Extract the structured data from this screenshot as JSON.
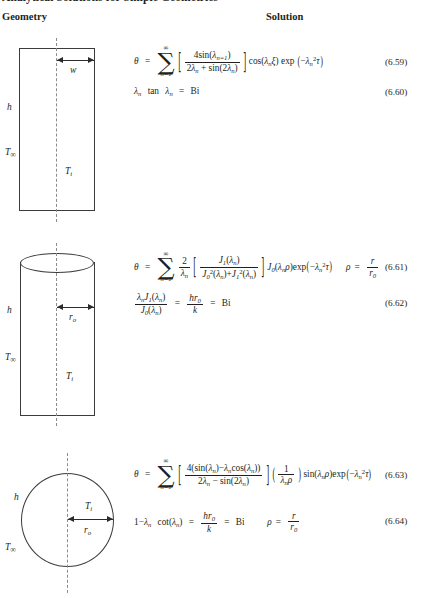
{
  "document": {
    "title": "Analytical Solutions for Simple Geometries",
    "columns": {
      "geometry": "Geometry",
      "solution": "Solution"
    }
  },
  "geometries": [
    {
      "name": "plane-slab",
      "shape": "rectangle",
      "labels": {
        "h": "h",
        "T_inf": "T",
        "T_inf_sub": "∞",
        "T_i": "T",
        "T_i_sub": "i",
        "dimension": "w"
      }
    },
    {
      "name": "infinite-cylinder",
      "shape": "cylinder",
      "labels": {
        "h": "h",
        "T_inf": "T",
        "T_inf_sub": "∞",
        "T_i": "T",
        "T_i_sub": "i",
        "dimension": "r",
        "dimension_sub": "o"
      }
    },
    {
      "name": "sphere",
      "shape": "circle",
      "labels": {
        "h": "h",
        "T_inf": "T",
        "T_inf_sub": "∞",
        "T_i": "T",
        "T_i_sub": "i",
        "dimension": "r",
        "dimension_sub": "o"
      }
    }
  ],
  "equations": [
    {
      "id": "6.59",
      "number": "(6.59)",
      "latex": "\\theta = \\sum_{n=1}^{\\infty}\\left[\\frac{4\\sin(\\lambda_n)}{2\\lambda_n + \\sin(2\\lambda_n)}\\right]\\cos(\\lambda_n\\xi)\\exp\\left(-\\lambda_n^2\\tau\\right)",
      "plain": "theta = sum n=1..inf [ 4 sin(lambda_n) / (2 lambda_n + sin(2 lambda_n)) ] cos(lambda_n xi) exp(-lambda_n^2 tau)"
    },
    {
      "id": "6.60",
      "number": "(6.60)",
      "latex": "\\lambda_n \\tan\\lambda_n = \\mathrm{Bi}",
      "plain": "lambda_n tan lambda_n = Bi"
    },
    {
      "id": "6.61",
      "number": "(6.61)",
      "latex": "\\theta = \\sum_{n=1}^{\\infty}\\frac{2}{\\lambda_n}\\left[\\frac{J_1(\\lambda_n)}{J_0^2(\\lambda_n)+J_1^2(\\lambda_n)}\\right]J_0(\\lambda_n\\rho)\\exp\\left(-\\lambda_n^2\\tau\\right)\\quad \\rho=\\frac{r}{r_0}",
      "plain": "theta = sum n=1..inf (2/lambda_n) [ J1(lambda_n) / (J0^2(lambda_n)+J1^2(lambda_n)) ] J0(lambda_n rho) exp(-lambda_n^2 tau)   rho = r / r_0"
    },
    {
      "id": "6.62",
      "number": "(6.62)",
      "latex": "\\frac{\\lambda_n J_1(\\lambda_n)}{J_0(\\lambda_n)} = \\frac{hr_0}{k} = \\mathrm{Bi}",
      "plain": "lambda_n J1(lambda_n) / J0(lambda_n) = h r_0 / k = Bi"
    },
    {
      "id": "6.63",
      "number": "(6.63)",
      "latex": "\\theta = \\sum_{n=1}^{\\infty}\\left[\\frac{4(\\sin(\\lambda_n)-\\lambda_n\\cos(\\lambda_n))}{2\\lambda_n-\\sin(2\\lambda_n)}\\right]\\left(\\frac{1}{\\lambda_n\\rho}\\right)\\sin(\\lambda_n\\rho)\\exp\\left(-\\lambda_n^2\\tau\\right)",
      "plain": "theta = sum n=1..inf [ 4(sin(lambda_n) - lambda_n cos(lambda_n)) / (2 lambda_n - sin(2 lambda_n)) ] (1/(lambda_n rho)) sin(lambda_n rho) exp(-lambda_n^2 tau)"
    },
    {
      "id": "6.64",
      "number": "(6.64)",
      "latex": "1-\\lambda_n\\cot(\\lambda_n) = \\frac{hr_0}{k} = \\mathrm{Bi}\\qquad \\rho=\\frac{r}{r_0}",
      "plain": "1 - lambda_n cot(lambda_n) = h r_0 / k = Bi    rho = r / r_0"
    }
  ],
  "symbols": {
    "theta": "θ",
    "lambda": "λ",
    "tau": "τ",
    "xi": "ξ",
    "rho": "ρ",
    "sum": "∑",
    "infinity": "∞",
    "minus": "−",
    "equals": "=",
    "plus": "+",
    "sum_lower": "n=1",
    "Bi": "Bi",
    "tan": "tan",
    "cos": "cos",
    "sin": "sin",
    "cot": "cot",
    "exp": "exp",
    "J": "J",
    "k": "k",
    "h": "h",
    "r": "r",
    "one": "1",
    "two": "2",
    "four": "4"
  },
  "colors": {
    "text": "#231f20",
    "outline": "#3b3b3b",
    "axis_dash": "#8c8c8c",
    "background": "#ffffff"
  }
}
